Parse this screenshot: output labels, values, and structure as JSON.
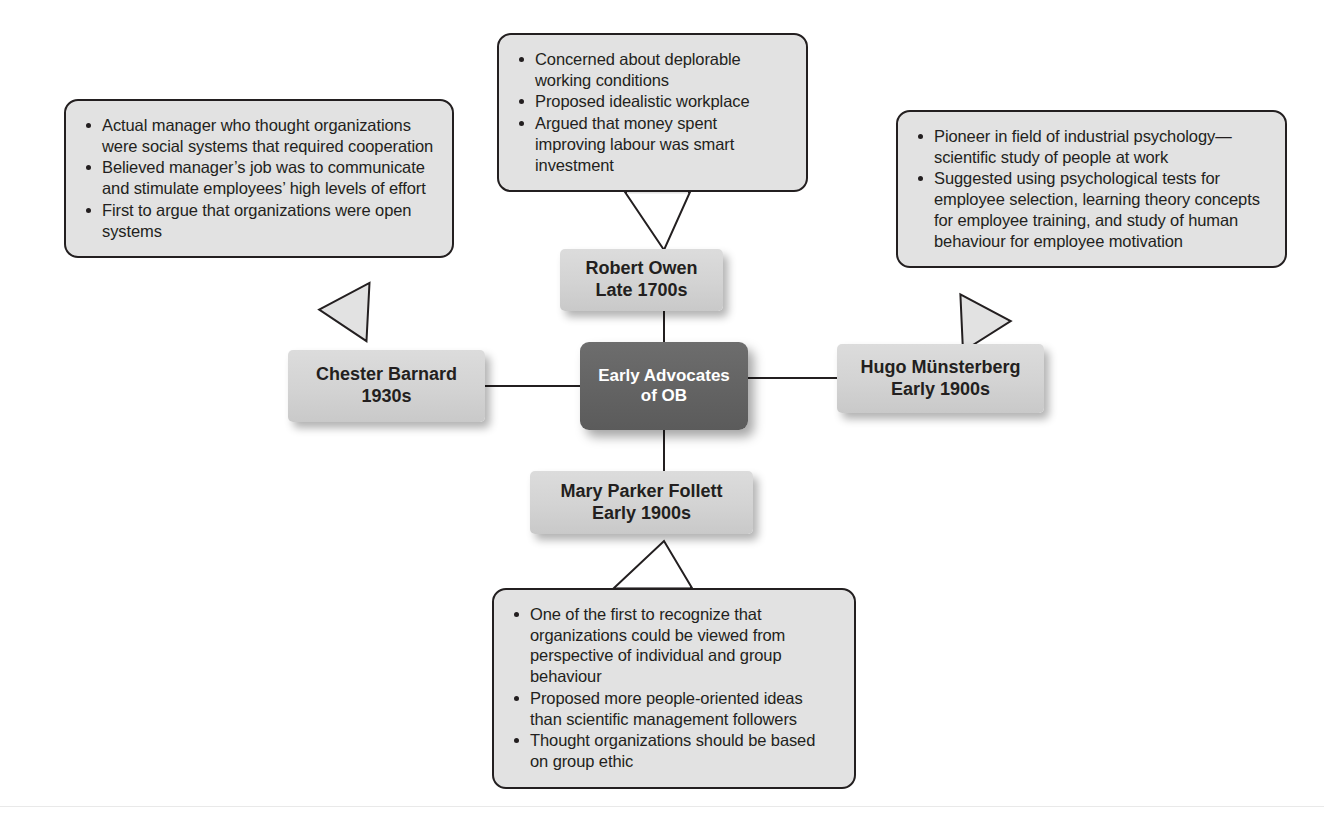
{
  "diagram": {
    "title": "Early Advocates of OB",
    "colors": {
      "hub_fill": "#636363",
      "hub_text": "#ffffff",
      "node_fill": "#d3d3d3",
      "node_text": "#231f20",
      "callout_fill": "#e2e2e2",
      "callout_border": "#231f20",
      "connector": "#231f20",
      "background": "#ffffff"
    },
    "center_node": {
      "line1": "Early Advocates",
      "line2": "of OB"
    },
    "nodes": [
      {
        "id": "robert-owen",
        "name": "Robert Owen",
        "era": "Late 1700s",
        "position": "top"
      },
      {
        "id": "hugo-munsterberg",
        "name": "Hugo Münsterberg",
        "era": "Early 1900s",
        "position": "right"
      },
      {
        "id": "mary-parker-follett",
        "name": "Mary Parker Follett",
        "era": "Early 1900s",
        "position": "bottom"
      },
      {
        "id": "chester-barnard",
        "name": "Chester Barnard",
        "era": "1930s",
        "position": "left"
      }
    ],
    "callouts": [
      {
        "id": "callout-robert-owen",
        "for": "Robert Owen",
        "position": "top",
        "bullets": [
          "Concerned about deplorable working conditions",
          "Proposed idealistic workplace",
          "Argued that money spent improving labour was smart investment"
        ]
      },
      {
        "id": "callout-chester-barnard",
        "for": "Chester Barnard",
        "position": "left",
        "bullets": [
          "Actual manager who thought organizations were social systems that required cooperation",
          "Believed manager’s job was to communicate and stimulate employees’ high levels of effort",
          "First to argue that organizations were open systems"
        ]
      },
      {
        "id": "callout-hugo-munsterberg",
        "for": "Hugo Münsterberg",
        "position": "right",
        "bullets": [
          "Pioneer in field of industrial psychology—scientific study of people at work",
          "Suggested using psychological tests for employee selection, learning theory concepts for employee training, and study of human behaviour for employee motivation"
        ]
      },
      {
        "id": "callout-mary-parker-follett",
        "for": "Mary Parker Follett",
        "position": "bottom",
        "bullets": [
          "One of the first to recognize that organizations could be viewed from perspective of individual and group behaviour",
          "Proposed more people-oriented ideas than scientific management followers",
          "Thought organizations should be based on group ethic"
        ]
      }
    ]
  }
}
